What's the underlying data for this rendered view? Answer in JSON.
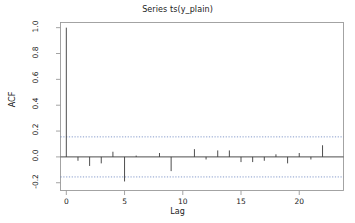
{
  "chart_data": {
    "type": "bar",
    "title": "Series ts(y_plain)",
    "xlabel": "Lag",
    "ylabel": "ACF",
    "x": [
      0,
      1,
      2,
      3,
      4,
      5,
      6,
      7,
      8,
      9,
      10,
      11,
      12,
      13,
      14,
      15,
      16,
      17,
      18,
      19,
      20,
      21,
      22,
      23
    ],
    "values": [
      1.0,
      -0.03,
      -0.07,
      -0.05,
      0.04,
      -0.19,
      0.01,
      0.0,
      0.03,
      -0.11,
      0.0,
      0.06,
      -0.02,
      0.05,
      0.05,
      -0.04,
      -0.04,
      -0.03,
      0.02,
      -0.05,
      0.03,
      -0.02,
      0.09,
      0.0
    ],
    "categories": [
      "0",
      "1",
      "2",
      "3",
      "4",
      "5",
      "6",
      "7",
      "8",
      "9",
      "10",
      "11",
      "12",
      "13",
      "14",
      "15",
      "16",
      "17",
      "18",
      "19",
      "20",
      "21",
      "22",
      "23"
    ],
    "xlim": [
      -0.5,
      23.8
    ],
    "ylim": [
      -0.26,
      1.04
    ],
    "xticks": [
      0,
      5,
      10,
      15,
      20
    ],
    "xticklabels": [
      "0",
      "5",
      "10",
      "15",
      "20"
    ],
    "yticks": [
      -0.2,
      0.0,
      0.2,
      0.4,
      0.6,
      0.8,
      1.0
    ],
    "yticklabels": [
      "-0.2",
      "0.0",
      "0.2",
      "0.4",
      "0.6",
      "0.8",
      "1.0"
    ],
    "grid": false,
    "legend": false,
    "confidence_bands": {
      "upper": 0.155,
      "lower": -0.155,
      "style": "dashed",
      "color": "#4f6fb5"
    },
    "zero_line": 0.0,
    "series_color": "#3a3a3a",
    "axis_color": "#9a9a9a"
  }
}
